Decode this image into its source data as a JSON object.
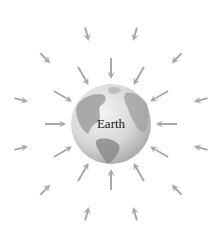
{
  "diagram": {
    "center_label": "Earth",
    "colors": {
      "arrow": "#a8a8a8",
      "globe_ocean": "#e2e2e2",
      "globe_land": "#9a9a9a",
      "label": "#1a1a1a"
    },
    "arrow_direction": "inward",
    "inner_ring": {
      "count": 12,
      "description": "field arrows near Earth"
    },
    "outer_ring": {
      "count": 12,
      "description": "field arrows farther from Earth"
    }
  }
}
